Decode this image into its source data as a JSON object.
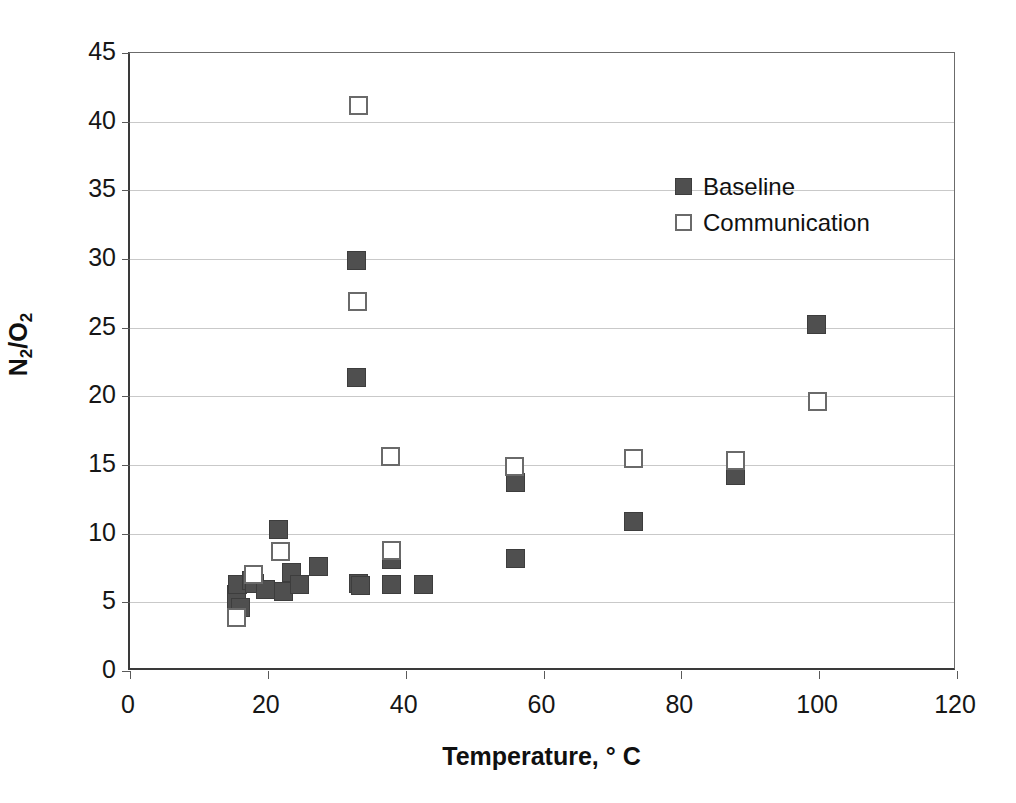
{
  "chart_data": {
    "type": "scatter",
    "title": "",
    "xlabel": "Temperature, ° C",
    "ylabel_html": "N<sub>2</sub>/O<sub>2</sub>",
    "ylabel": "N2/O2",
    "xlim": [
      0,
      120
    ],
    "ylim": [
      0,
      45
    ],
    "xticks": [
      0,
      20,
      40,
      60,
      80,
      100,
      120
    ],
    "yticks": [
      0,
      5,
      10,
      15,
      20,
      25,
      30,
      35,
      40,
      45
    ],
    "grid": "horizontal",
    "legend_position": "upper-center-right",
    "series": [
      {
        "name": "Baseline",
        "marker": "filled-square",
        "color": "#4f4f4f",
        "points": [
          [
            15.4,
            5.6
          ],
          [
            15.4,
            5.0
          ],
          [
            15.6,
            6.3
          ],
          [
            16.0,
            4.6
          ],
          [
            17.6,
            6.6
          ],
          [
            18.0,
            6.4
          ],
          [
            19.6,
            5.9
          ],
          [
            21.6,
            10.3
          ],
          [
            22.3,
            5.8
          ],
          [
            23.4,
            7.2
          ],
          [
            24.6,
            6.3
          ],
          [
            27.4,
            7.6
          ],
          [
            32.8,
            29.9
          ],
          [
            32.9,
            21.4
          ],
          [
            33.2,
            6.4
          ],
          [
            33.4,
            6.2
          ],
          [
            37.9,
            8.1
          ],
          [
            38.0,
            6.3
          ],
          [
            42.6,
            6.3
          ],
          [
            55.9,
            13.7
          ],
          [
            56.0,
            8.2
          ],
          [
            73.0,
            10.9
          ],
          [
            87.8,
            14.2
          ],
          [
            99.6,
            25.2
          ]
        ]
      },
      {
        "name": "Communication",
        "marker": "open-square",
        "color": "#ffffff",
        "points": [
          [
            15.5,
            3.9
          ],
          [
            17.9,
            7.0
          ],
          [
            21.8,
            8.7
          ],
          [
            33.2,
            41.2
          ],
          [
            33.0,
            26.9
          ],
          [
            37.8,
            15.6
          ],
          [
            38.0,
            8.8
          ],
          [
            55.8,
            14.9
          ],
          [
            73.0,
            15.5
          ],
          [
            87.8,
            15.3
          ],
          [
            99.7,
            19.6
          ]
        ]
      }
    ]
  },
  "legend": {
    "items": [
      {
        "label": "Baseline",
        "style": "baseline"
      },
      {
        "label": "Communication",
        "style": "communication"
      }
    ]
  }
}
